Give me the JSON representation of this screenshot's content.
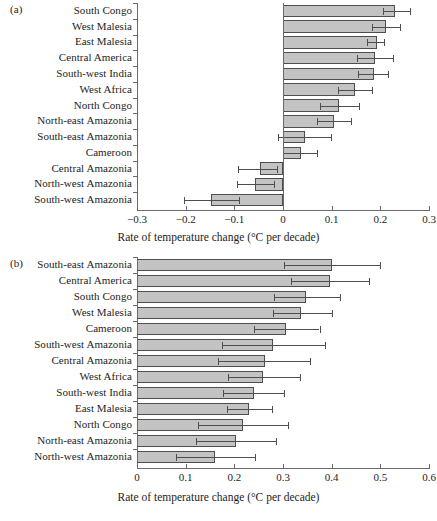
{
  "figure": {
    "panel_a_letter": "(a)",
    "panel_b_letter": "(b)",
    "axis_title": "Rate of temperature change (°C per decade)",
    "bar_fill": "#c3c3c3",
    "bar_stroke": "#4e4e4e",
    "axis_color": "#6a6a6a"
  },
  "chart_data": [
    {
      "id": "panel-a",
      "type": "bar",
      "orientation": "horizontal",
      "panel": "(a)",
      "title": "",
      "xlabel": "Rate of temperature change (°C per decade)",
      "ylabel": "",
      "xlim": [
        -0.3,
        0.3
      ],
      "xticks": [
        -0.3,
        -0.2,
        -0.1,
        0,
        0.1,
        0.2,
        0.3
      ],
      "xticklabels": [
        "−0.3",
        "−0.2",
        "−0.1",
        "0",
        "0.1",
        "0.2",
        "0.3"
      ],
      "grid": false,
      "legend": "none",
      "error_bars": true,
      "categories": [
        "South Congo",
        "West Malesia",
        "East Malesia",
        "Central America",
        "South-west India",
        "West Africa",
        "North Congo",
        "North-east Amazonia",
        "South-east Amazonia",
        "Cameroon",
        "Central Amazonia",
        "North-west Amazonia",
        "South-west Amazonia"
      ],
      "values": [
        0.231,
        0.211,
        0.193,
        0.189,
        0.186,
        0.147,
        0.115,
        0.104,
        0.046,
        0.038,
        -0.048,
        -0.057,
        -0.147
      ],
      "err_low": [
        0.205,
        0.182,
        0.172,
        0.152,
        0.155,
        0.113,
        0.077,
        0.07,
        -0.01,
        0.001,
        -0.093,
        -0.094,
        -0.203
      ],
      "err_high": [
        0.26,
        0.24,
        0.207,
        0.226,
        0.215,
        0.182,
        0.156,
        0.14,
        0.098,
        0.07,
        -0.012,
        -0.018,
        -0.09
      ]
    },
    {
      "id": "panel-b",
      "type": "bar",
      "orientation": "horizontal",
      "panel": "(b)",
      "title": "",
      "xlabel": "Rate of temperature change (°C per decade)",
      "ylabel": "",
      "xlim": [
        0,
        0.6
      ],
      "xticks": [
        0,
        0.1,
        0.2,
        0.3,
        0.4,
        0.5,
        0.6
      ],
      "xticklabels": [
        "0",
        "0.1",
        "0.2",
        "0.3",
        "0.4",
        "0.5",
        "0.6"
      ],
      "grid": false,
      "legend": "none",
      "error_bars": true,
      "categories": [
        "South-east Amazonia",
        "Central America",
        "South Congo",
        "West Malesia",
        "Cameroon",
        "South-west Amazonia",
        "Central Amazonia",
        "West Africa",
        "South-west India",
        "East Malesia",
        "North Congo",
        "North-east Amazonia",
        "North-west Amazonia"
      ],
      "values": [
        0.4,
        0.397,
        0.348,
        0.338,
        0.306,
        0.279,
        0.262,
        0.259,
        0.24,
        0.23,
        0.217,
        0.203,
        0.161
      ],
      "err_low": [
        0.303,
        0.317,
        0.281,
        0.28,
        0.24,
        0.174,
        0.167,
        0.186,
        0.177,
        0.184,
        0.126,
        0.122,
        0.081
      ],
      "err_high": [
        0.5,
        0.477,
        0.418,
        0.4,
        0.375,
        0.387,
        0.355,
        0.334,
        0.302,
        0.277,
        0.311,
        0.286,
        0.243
      ]
    }
  ]
}
